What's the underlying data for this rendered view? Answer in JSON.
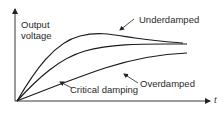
{
  "diagram": {
    "title": "",
    "y_axis_label_line1": "Output",
    "y_axis_label_line2": "voltage",
    "x_axis_label": "t",
    "curves": [
      {
        "name": "underdamped",
        "label": "Underdamped"
      },
      {
        "name": "critical-damping",
        "label": "Critical damping"
      },
      {
        "name": "overdamped",
        "label": "Overdamped"
      }
    ],
    "colors": {
      "line": "#1a1a1a",
      "axis": "#3a3a3a",
      "text": "#2a2a2a",
      "background": "#ffffff"
    }
  }
}
